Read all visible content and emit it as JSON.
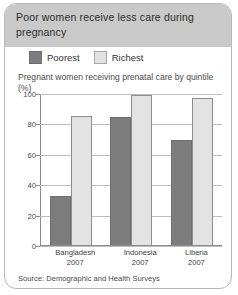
{
  "card": {
    "title": "Poor women receive less care during pregnancy",
    "source": "Source: Demographic and Health Surveys"
  },
  "chart_data": {
    "type": "bar",
    "title": "Poor women receive less care during pregnancy",
    "subtitle": "Pregnant women receiving prenatal care by quintile (%)",
    "xlabel": "",
    "ylabel": "",
    "ylim": [
      0,
      100
    ],
    "yticks": [
      0,
      20,
      40,
      60,
      80,
      100
    ],
    "grid": true,
    "legend_position": "top-left",
    "categories": [
      "Bangladesh",
      "Indonesia",
      "Liberia"
    ],
    "category_years": [
      "2007",
      "2007",
      "2007"
    ],
    "series": [
      {
        "name": "Poorest",
        "color": "#7d7d7d",
        "values": [
          32,
          84,
          69
        ]
      },
      {
        "name": "Richest",
        "color": "#e3e3e3",
        "values": [
          85,
          99,
          97
        ]
      }
    ],
    "source": "Source: Demographic and Health Surveys"
  }
}
